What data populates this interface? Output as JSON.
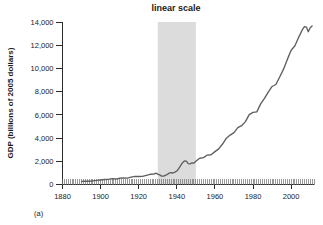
{
  "figure": {
    "title": "linear scale",
    "panel_label": "(a)",
    "ylabel": "GDP (billions of 2005 dollars)"
  },
  "chart_data": {
    "type": "line",
    "title": "linear scale",
    "xlabel": "",
    "ylabel": "GDP (billions of 2005 dollars)",
    "xlim": [
      1880,
      2012
    ],
    "ylim": [
      0,
      14000
    ],
    "grid": false,
    "legend": null,
    "x_ticks": [
      1880,
      1900,
      1920,
      1940,
      1960,
      1980,
      2000
    ],
    "x_tick_labels": [
      "1880",
      "1900",
      "1920",
      "1940",
      "1960",
      "1980",
      "2000"
    ],
    "x_minor_tick_step": 1,
    "y_ticks": [
      0,
      2000,
      4000,
      6000,
      8000,
      10000,
      12000,
      14000
    ],
    "y_tick_labels": [
      "0",
      "2,000",
      "4,000",
      "6,000",
      "8,000",
      "10,000",
      "12,000",
      "14,000"
    ],
    "shaded_regions": [
      {
        "label": "",
        "x_start": 1930,
        "x_end": 1950,
        "color": "#dcdcdc"
      }
    ],
    "line_color": "#5f5f5f",
    "series": [
      {
        "name": "Real GDP",
        "x": [
          1890,
          1892,
          1894,
          1896,
          1898,
          1900,
          1902,
          1904,
          1906,
          1908,
          1910,
          1912,
          1914,
          1916,
          1918,
          1920,
          1922,
          1924,
          1926,
          1928,
          1929,
          1930,
          1931,
          1932,
          1933,
          1934,
          1935,
          1936,
          1937,
          1938,
          1939,
          1940,
          1941,
          1942,
          1943,
          1944,
          1945,
          1946,
          1947,
          1948,
          1949,
          1950,
          1952,
          1954,
          1956,
          1958,
          1960,
          1962,
          1964,
          1966,
          1968,
          1970,
          1972,
          1974,
          1976,
          1978,
          1980,
          1982,
          1984,
          1986,
          1988,
          1990,
          1992,
          1994,
          1996,
          1998,
          2000,
          2002,
          2004,
          2006,
          2007,
          2008,
          2009,
          2010,
          2011
        ],
        "y": [
          260,
          290,
          280,
          315,
          350,
          390,
          430,
          440,
          505,
          470,
          540,
          570,
          545,
          640,
          700,
          690,
          700,
          790,
          880,
          900,
          977,
          892,
          834,
          725,
          716,
          794,
          864,
          977,
          1028,
          992,
          1072,
          1166,
          1366,
          1618,
          1883,
          2035,
          2012,
          1792,
          1776,
          1854,
          1844,
          2006,
          2262,
          2313,
          2536,
          2566,
          2830,
          3072,
          3487,
          3989,
          4257,
          4470,
          4900,
          5065,
          5418,
          6016,
          6214,
          6260,
          6946,
          7417,
          7957,
          8445,
          8617,
          9267,
          9937,
          10780,
          11570,
          11950,
          12700,
          13370,
          13610,
          13560,
          13160,
          13500,
          13650
        ]
      }
    ],
    "notes": [
      "Shaded vertical band marks the 1930-1950 period.",
      "Curve begins in 1890 near 260 and ends in 2011 near 13,650."
    ]
  }
}
